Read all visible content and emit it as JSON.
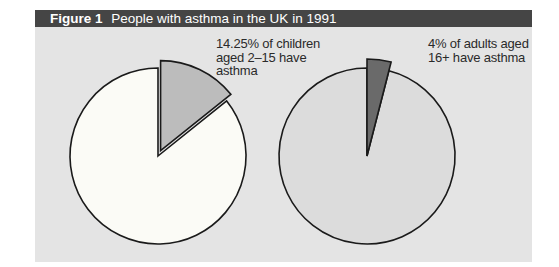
{
  "figure": {
    "number": "Figure 1",
    "title": "People with asthma in the UK in 1991"
  },
  "labels": {
    "children": [
      "14.25% of children",
      "aged 2–15 have",
      "asthma"
    ],
    "adults": [
      "4% of adults aged",
      "16+ have asthma"
    ]
  },
  "colors": {
    "title_bar": "#454545",
    "panel_bg": "#e4e4e4",
    "children_rest": "#fbfbf6",
    "children_asthma": "#bcbcbc",
    "adults_rest": "#dcdcdc",
    "adults_asthma": "#6a6a6a",
    "outline": "#1a1a1a"
  },
  "chart_data": [
    {
      "type": "pie",
      "title": "Children aged 2–15",
      "categories": [
        "Have asthma",
        "Do not have asthma"
      ],
      "values": [
        14.25,
        85.75
      ],
      "exploded": [
        true,
        false
      ],
      "annotation": "14.25% of children aged 2–15 have asthma"
    },
    {
      "type": "pie",
      "title": "Adults aged 16+",
      "categories": [
        "Have asthma",
        "Do not have asthma"
      ],
      "values": [
        4,
        96
      ],
      "exploded": [
        true,
        false
      ],
      "annotation": "4% of adults aged 16+ have asthma"
    }
  ]
}
